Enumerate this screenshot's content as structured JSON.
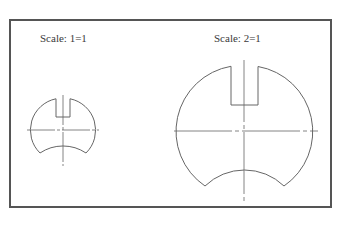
{
  "figure": {
    "frame": {
      "x": 10,
      "y": 20,
      "width": 321,
      "height": 187,
      "stroke": "#555555"
    },
    "line_color": "#666666",
    "views": [
      {
        "label": "Scale: 1=1",
        "label_pos": {
          "x": 40,
          "y": 32
        },
        "center": {
          "x": 63,
          "y": 130
        },
        "radius": 32,
        "slot": {
          "x1": 56,
          "x2": 70,
          "top": 98,
          "bottom": 117
        },
        "bottom_cut": {
          "x1": 40,
          "x2": 86,
          "y": 153,
          "arc_peak_y": 146
        },
        "centerline_h": {
          "x1": 27,
          "x2": 99
        },
        "centerline_v": {
          "y1": 95,
          "y2": 166
        }
      },
      {
        "label": "Scale: 2=1",
        "label_pos": {
          "x": 214,
          "y": 32
        },
        "center": {
          "x": 244,
          "y": 131
        },
        "radius": 66,
        "slot": {
          "x1": 231,
          "x2": 258,
          "top": 66,
          "bottom": 105
        },
        "bottom_cut": {
          "x1": 205,
          "x2": 284,
          "y": 186,
          "arc_peak_y": 170
        },
        "centerline_h": {
          "x1": 174,
          "x2": 318
        },
        "centerline_v": {
          "y1": 60,
          "y2": 202
        }
      }
    ]
  }
}
